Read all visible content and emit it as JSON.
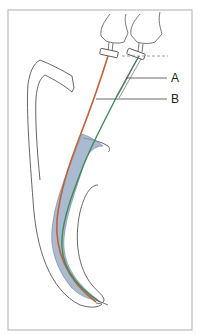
{
  "diagram": {
    "type": "dental endodontic illustration",
    "labels": {
      "A": "A",
      "B": "B"
    },
    "colors": {
      "frame": "#b8b8b8",
      "outline": "#555555",
      "file_a": "#c0603c",
      "file_b": "#3f8a5c",
      "canal_fill": "#7f97b4",
      "background": "#ffffff"
    }
  }
}
